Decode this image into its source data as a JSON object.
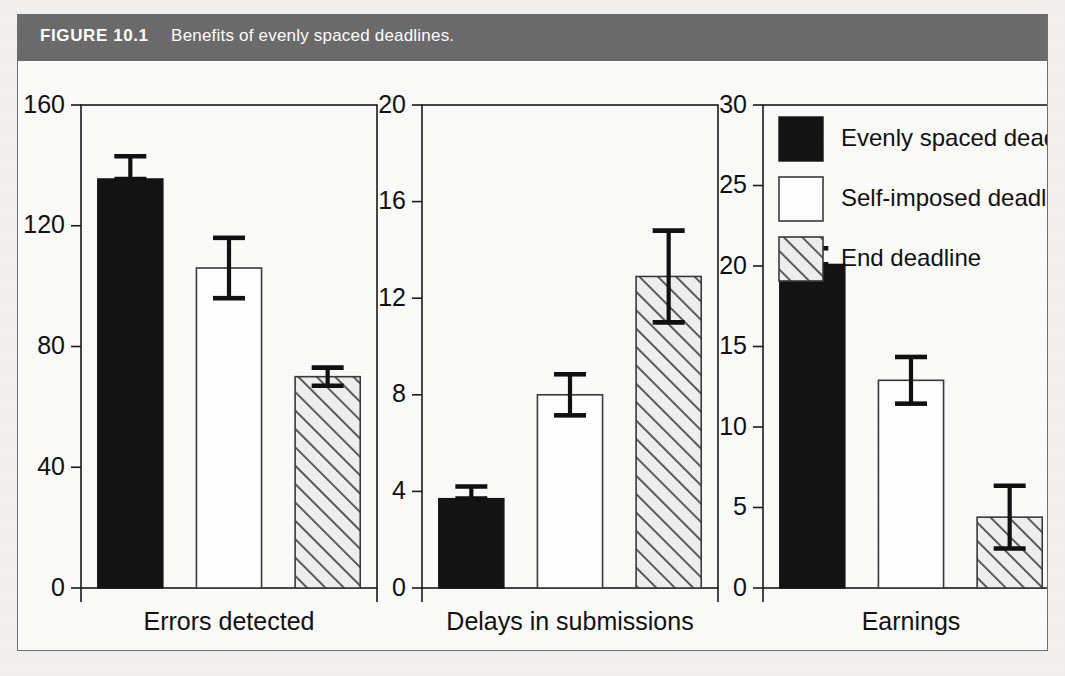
{
  "figure": {
    "number_label": "FIGURE 10.1",
    "caption": "Benefits of evenly spaced deadlines.",
    "caption_bar_color": "#6b6b6b",
    "page_background": "#f2f1ef"
  },
  "legend": {
    "position": "top-right-inside-panel-3",
    "entries": [
      {
        "label": "Evenly spaced deadlines",
        "style": "solid-black",
        "color": "#141414"
      },
      {
        "label": "Self-imposed deadlines",
        "style": "open-white",
        "color": "#ffffff"
      },
      {
        "label": "End deadline",
        "style": "diagonal-hatch",
        "color": "#e8e8e8"
      }
    ]
  },
  "chart_data": {
    "type": "bar",
    "title": "Benefits of evenly spaced deadlines.",
    "xlabel": "",
    "ylabel": "",
    "grid": false,
    "error_bars": "standard error",
    "categories": [
      "Errors detected",
      "Delays in submissions",
      "Earnings"
    ],
    "series": [
      {
        "name": "Evenly spaced deadlines",
        "values": [
          135.5,
          3.7,
          20.1
        ]
      },
      {
        "name": "Self-imposed deadlines",
        "values": [
          106.0,
          8.0,
          12.9
        ]
      },
      {
        "name": "End deadline",
        "values": [
          70.0,
          12.9,
          4.4
        ]
      }
    ],
    "errors": [
      {
        "name": "Evenly spaced deadlines",
        "values": [
          7.5,
          0.5,
          1.0
        ]
      },
      {
        "name": "Self-imposed deadlines",
        "values": [
          10.0,
          0.85,
          1.45
        ]
      },
      {
        "name": "End deadline",
        "values": [
          3.0,
          1.9,
          1.95
        ]
      }
    ],
    "panels": [
      {
        "id": "errors-detected",
        "xlabel": "Errors detected",
        "ylim": [
          0,
          160
        ],
        "yticks": [
          0,
          40,
          80,
          120,
          160
        ],
        "ytick_labels": [
          "0",
          "40",
          "80",
          "120",
          "160"
        ],
        "bars": [
          {
            "series": "Evenly spaced deadlines",
            "value": 135.5,
            "err_up": 7.5,
            "err_down": 0
          },
          {
            "series": "Self-imposed deadlines",
            "value": 106.0,
            "err_up": 10.0,
            "err_down": 10.0
          },
          {
            "series": "End deadline",
            "value": 70.0,
            "err_up": 3.0,
            "err_down": 3.0
          }
        ]
      },
      {
        "id": "delays-in-submissions",
        "xlabel": "Delays in submissions",
        "ylim": [
          0,
          20
        ],
        "yticks": [
          0,
          4,
          8,
          12,
          16,
          20
        ],
        "ytick_labels": [
          "0",
          "4",
          "8",
          "12",
          "16",
          "20"
        ],
        "bars": [
          {
            "series": "Evenly spaced deadlines",
            "value": 3.7,
            "err_up": 0.5,
            "err_down": 0
          },
          {
            "series": "Self-imposed deadlines",
            "value": 8.0,
            "err_up": 0.85,
            "err_down": 0.85
          },
          {
            "series": "End deadline",
            "value": 12.9,
            "err_up": 1.9,
            "err_down": 1.9
          }
        ]
      },
      {
        "id": "earnings",
        "xlabel": "Earnings",
        "ylim": [
          0,
          30
        ],
        "yticks": [
          0,
          5,
          10,
          15,
          20,
          25,
          30
        ],
        "ytick_labels": [
          "0",
          "5",
          "10",
          "15",
          "20",
          "25",
          "30"
        ],
        "bars": [
          {
            "series": "Evenly spaced deadlines",
            "value": 20.1,
            "err_up": 1.0,
            "err_down": 0
          },
          {
            "series": "Self-imposed deadlines",
            "value": 12.9,
            "err_up": 1.45,
            "err_down": 1.45
          },
          {
            "series": "End deadline",
            "value": 4.4,
            "err_up": 1.95,
            "err_down": 1.95
          }
        ]
      }
    ]
  }
}
